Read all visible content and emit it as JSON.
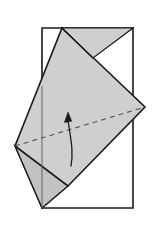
{
  "diagram": {
    "type": "origami-fold-step",
    "canvas": {
      "width": 159,
      "height": 244,
      "background": "#ffffff"
    },
    "colors": {
      "paper_fill": "#cfcfcf",
      "paper_fill_shadow": "#c2c2c2",
      "paper_fill_light": "#d6d6d6",
      "outline": "#1a1a1a",
      "crease_dashed": "#555555",
      "thin_line": "#666666",
      "arrow": "#1a1a1a",
      "background": "#ffffff"
    },
    "shapes": {
      "base_rectangle": {
        "name": "base-sheet-rectangle",
        "points": "42,28 133,28 133,208 42,208",
        "fill": "#ffffff",
        "stroke": "#1a1a1a",
        "stroke_width": 1.6
      },
      "folded_kite": {
        "name": "folded-flap-kite",
        "points": "62,28 145,107 68,186 15,146",
        "fill": "#cfcfcf",
        "stroke": "#1a1a1a",
        "stroke_width": 1.6
      },
      "upper_fold_triangle": {
        "name": "upper-fold-triangle",
        "points": "62,28 133,28 93,58",
        "fill": "#cfcfcf",
        "stroke": "#1a1a1a",
        "stroke_width": 1.2
      },
      "lower_fold_triangle": {
        "name": "lower-fold-triangle",
        "points": "15,146 68,186 42,208",
        "fill": "#c2c2c2",
        "stroke": "#1a1a1a",
        "stroke_width": 1.4
      },
      "lower_left_wedge": {
        "name": "lower-left-wedge",
        "points": "15,146 42,208 33,179",
        "fill": "#c9c9c9",
        "stroke": "#1a1a1a",
        "stroke_width": 1.2
      }
    },
    "lines": {
      "inner_crease_top": {
        "name": "inner-crease-top-line",
        "x1": 62,
        "y1": 28,
        "x2": 93,
        "y2": 58,
        "stroke": "#1a1a1a",
        "stroke_width": 1.2
      },
      "vertical_edge_line": {
        "name": "sheet-left-edge-line",
        "x1": 42,
        "y1": 86,
        "x2": 42,
        "y2": 208,
        "stroke": "#666666",
        "stroke_width": 1.0
      },
      "dashed_crease": {
        "name": "valley-crease-dashed-line",
        "x1": 15,
        "y1": 146,
        "x2": 145,
        "y2": 107,
        "stroke": "#555555",
        "stroke_width": 1.1,
        "dash": "5,4"
      }
    },
    "arrow": {
      "name": "fold-direction-arrow",
      "label": "fold upward",
      "path": "M 71,166 C 74,150 70,136 68,120",
      "head": "68,113 64.5,122 71.5,121.5",
      "stroke": "#1a1a1a",
      "stroke_width": 1.3
    }
  }
}
